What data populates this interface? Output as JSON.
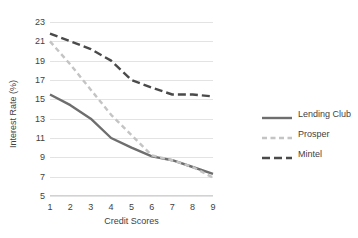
{
  "chart_data": {
    "type": "line",
    "title": "",
    "xlabel": "Credit Scores",
    "ylabel": "Interest Rate (%)",
    "x": [
      1,
      2,
      3,
      4,
      5,
      6,
      7,
      8,
      9
    ],
    "xtick_labels": [
      "1",
      "2",
      "3",
      "4",
      "5",
      "6",
      "7",
      "8",
      "9"
    ],
    "ytick_labels": [
      "23",
      "21",
      "19",
      "17",
      "15",
      "13",
      "11",
      "9",
      "7",
      "5"
    ],
    "yticks": [
      23,
      21,
      19,
      17,
      15,
      13,
      11,
      9,
      7,
      5
    ],
    "ylim": [
      5,
      23
    ],
    "xlim": [
      1,
      9
    ],
    "grid": "horizontal",
    "legend_position": "right",
    "series": [
      {
        "name": "Lending Club",
        "values": [
          15.5,
          14.4,
          13.0,
          11.0,
          10.0,
          9.1,
          8.7,
          8.0,
          7.3
        ],
        "color": "#6e6e6e",
        "style": "solid"
      },
      {
        "name": "Prosper",
        "values": [
          21.0,
          18.6,
          16.0,
          13.4,
          11.3,
          9.2,
          8.7,
          8.0,
          6.9
        ],
        "color": "#c4c4c4",
        "style": "dashed"
      },
      {
        "name": "Mintel",
        "values": [
          21.8,
          21.0,
          20.2,
          19.0,
          17.0,
          16.2,
          15.5,
          15.5,
          15.3
        ],
        "color": "#4a4a4a",
        "style": "dashed-long"
      }
    ]
  },
  "title_remnant": "",
  "colors": {
    "gridline": "#e3e3e3",
    "axis": "#d2d2d2",
    "text": "#3f3f3f",
    "background": "#ffffff"
  }
}
